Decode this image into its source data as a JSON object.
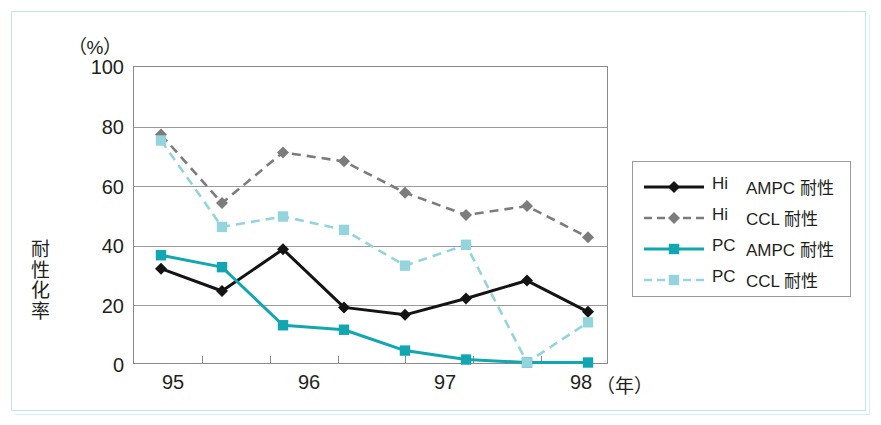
{
  "axes": {
    "y_unit": "（%）",
    "y_title_chars": [
      "耐",
      "性",
      "化",
      "率"
    ],
    "y_ticks": [
      "100",
      "80",
      "60",
      "40",
      "20",
      "0"
    ],
    "x_ticks": [
      "95",
      "96",
      "97",
      "98"
    ],
    "x_unit": "（年）"
  },
  "legend": {
    "items": [
      {
        "code": "Hi",
        "desc": "AMPC 耐性",
        "color": "#141414",
        "style": "solid",
        "marker": "diamond",
        "name": "hi-ampc"
      },
      {
        "code": "Hi",
        "desc": "CCL 耐性",
        "color": "#7c7c7c",
        "style": "dashed",
        "marker": "diamond",
        "name": "hi-ccl"
      },
      {
        "code": "PC",
        "desc": "AMPC 耐性",
        "color": "#12a7b0",
        "style": "solid",
        "marker": "square",
        "name": "pc-ampc"
      },
      {
        "code": "PC",
        "desc": "CCL 耐性",
        "color": "#93d4dd",
        "style": "dashed",
        "marker": "square",
        "name": "pc-ccl"
      }
    ]
  },
  "colors": {
    "hi_ampc": "#141414",
    "hi_ccl": "#7c7c7c",
    "pc_ampc": "#12a7b0",
    "pc_ccl": "#93d4dd",
    "frame": "#bfe6e8",
    "grid": "#9a9a9a",
    "text": "#231f20"
  },
  "chart_data": {
    "type": "line",
    "title": "",
    "xlabel": "（年）",
    "ylabel": "耐性化率",
    "y_unit": "（%）",
    "ylim": [
      0,
      100
    ],
    "yticks": [
      0,
      20,
      40,
      60,
      80,
      100
    ],
    "grid": true,
    "legend_position": "right",
    "x": [
      95,
      95.5,
      96,
      96.5,
      97,
      97.5,
      98,
      98.5
    ],
    "xtick_labels": [
      "95",
      "",
      "96",
      "",
      "97",
      "",
      "98",
      ""
    ],
    "series": [
      {
        "name": "Hi　AMPC 耐性",
        "code": "Hi",
        "drug": "AMPC",
        "color": "#141414",
        "style": "solid",
        "marker": "diamond",
        "values": [
          32,
          24.5,
          38.5,
          19,
          16.5,
          22,
          28,
          17.5
        ]
      },
      {
        "name": "Hi　CCL 耐性",
        "code": "Hi",
        "drug": "CCL",
        "color": "#7c7c7c",
        "style": "dashed",
        "marker": "diamond",
        "values": [
          77,
          54,
          71,
          68,
          57.5,
          50,
          53,
          42.5
        ]
      },
      {
        "name": "PC　AMPC 耐性",
        "code": "PC",
        "drug": "AMPC",
        "color": "#12a7b0",
        "style": "solid",
        "marker": "square",
        "values": [
          36.5,
          32.5,
          13,
          11.5,
          4.5,
          1.5,
          0.5,
          0.5
        ]
      },
      {
        "name": "PC　CCL 耐性",
        "code": "PC",
        "drug": "CCL",
        "color": "#93d4dd",
        "style": "dashed",
        "marker": "square",
        "values": [
          75,
          46,
          49.5,
          45,
          33,
          40,
          0.5,
          14
        ]
      }
    ]
  }
}
